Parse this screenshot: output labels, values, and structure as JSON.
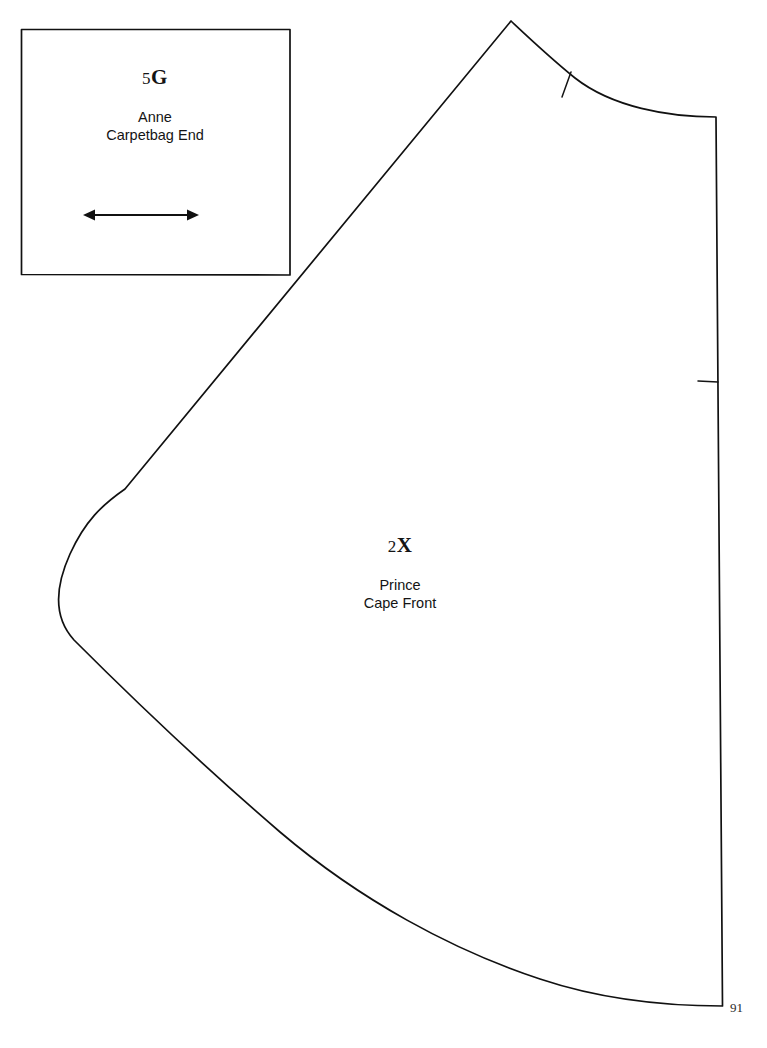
{
  "document": {
    "type": "sewing-pattern-sheet",
    "page_number": "91",
    "background_color": "#ffffff",
    "line_color": "#111111"
  },
  "pieces": [
    {
      "id": "piece-5g",
      "code_number": "5",
      "code_letter": "G",
      "code": "5G",
      "garment": "Anne",
      "part": "Carpetbag End",
      "name_line_1": "Anne",
      "name_line_2": "Carpetbag End",
      "shape": "square",
      "has_grainline": true,
      "grainline": "double-headed-horizontal-arrow"
    },
    {
      "id": "piece-2x",
      "code_number": "2",
      "code_letter": "X",
      "code": "2X",
      "garment": "Prince",
      "part": "Cape Front",
      "name_line_1": "Prince",
      "name_line_2": "Cape Front",
      "shape": "cape-front-curved",
      "has_grainline": false,
      "notches": [
        {
          "name": "neckline-notch",
          "location": "neckline-curve"
        },
        {
          "name": "side-notch",
          "location": "right-straight-edge"
        }
      ]
    }
  ],
  "page": {
    "number_label": "91"
  }
}
